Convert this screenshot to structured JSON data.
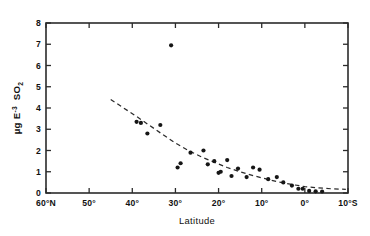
{
  "figure": {
    "background_color": "#ffffff",
    "axis_color": "#2b2b2b",
    "marker_color": "#161616"
  },
  "chart_data": {
    "type": "scatter",
    "title": "",
    "xlabel": "Latitude",
    "ylabel": "µg E⁻³  SO₂",
    "ylabel_parts": {
      "prefix": "µg E",
      "exponent": "-3",
      "species": "SO",
      "species_sub": "2"
    },
    "xlim": [
      60,
      -10
    ],
    "ylim": [
      0,
      8
    ],
    "grid": false,
    "legend": null,
    "xticklabels": [
      "60°N",
      "50°",
      "40°",
      "30°",
      "20°",
      "10°",
      "0°",
      "10°S"
    ],
    "xtickvalues": [
      60,
      50,
      40,
      30,
      20,
      10,
      0,
      -10
    ],
    "yticklabels": [
      "0",
      "1",
      "2",
      "3",
      "4",
      "5",
      "6",
      "7",
      "8"
    ],
    "ytickvalues": [
      0,
      1,
      2,
      3,
      4,
      5,
      6,
      7,
      8
    ],
    "series": [
      {
        "name": "SO2 concentration",
        "marker": "filled-circle",
        "x": [
          39.0,
          38.0,
          36.5,
          33.5,
          31.0,
          29.5,
          28.8,
          26.5,
          23.5,
          22.5,
          21.0,
          20.0,
          19.5,
          18.0,
          17.0,
          15.5,
          13.5,
          12.0,
          10.5,
          8.5,
          6.5,
          5.0,
          3.0,
          1.5,
          0.5,
          -1.0,
          -2.5,
          -4.0
        ],
        "y": [
          3.35,
          3.3,
          2.8,
          3.2,
          6.95,
          1.2,
          1.4,
          1.9,
          2.0,
          1.35,
          1.5,
          0.95,
          1.0,
          1.55,
          0.8,
          1.15,
          0.75,
          1.2,
          1.1,
          0.65,
          0.75,
          0.5,
          0.35,
          0.2,
          0.2,
          0.1,
          0.08,
          0.07
        ]
      }
    ],
    "fit_curve": {
      "name": "exponential decay trend",
      "style": "dashed",
      "x": [
        45.0,
        42.0,
        39.0,
        36.0,
        33.0,
        30.0,
        27.0,
        24.0,
        21.0,
        18.0,
        15.0,
        12.0,
        9.0,
        6.0,
        3.0,
        0.0,
        -3.0,
        -6.0,
        -9.5
      ],
      "y": [
        4.4,
        4.0,
        3.6,
        3.18,
        2.76,
        2.35,
        2.0,
        1.7,
        1.45,
        1.2,
        1.0,
        0.82,
        0.66,
        0.52,
        0.4,
        0.3,
        0.24,
        0.2,
        0.17
      ]
    }
  }
}
